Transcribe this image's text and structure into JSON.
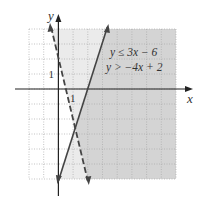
{
  "chart_data": {
    "type": "line",
    "title": "",
    "xlabel": "x",
    "ylabel": "y",
    "xlim": [
      -2,
      8
    ],
    "ylim": [
      -6,
      4
    ],
    "grid": true,
    "grid_step": 1,
    "tick_labels": {
      "x": [
        "1"
      ],
      "y": [
        "1"
      ]
    },
    "series": [
      {
        "name": "y ≤ 3x − 6",
        "slope": 3,
        "intercept": -6,
        "style": "solid",
        "inequality": "<=",
        "x": [
          -0.0,
          3.33
        ],
        "y": [
          -6,
          4
        ]
      },
      {
        "name": "y > −4x + 2",
        "slope": -4,
        "intercept": 2,
        "style": "dashed",
        "inequality": ">",
        "x": [
          -0.5,
          2.0
        ],
        "y": [
          4,
          -6
        ]
      }
    ],
    "intersection": {
      "x": 1.1429,
      "y": -2.5714
    },
    "legend": [
      "y ≤ 3x − 6",
      "y > −4x + 2"
    ],
    "legend_position": "top-right",
    "colors": {
      "light_shade": "#ebebeb",
      "dark_shade": "#d4d4d4",
      "grid": "#aaaaaa",
      "axis": "#222222",
      "line": "#444444"
    }
  }
}
